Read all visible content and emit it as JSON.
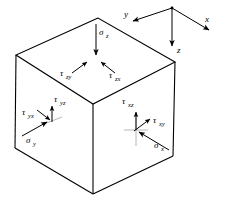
{
  "figure": {
    "name": "stress-element-cube",
    "background_color": "#ffffff",
    "stroke_color": "#000000",
    "width": 227,
    "height": 201
  },
  "axes": {
    "origin": {
      "x": 172,
      "y": 8
    },
    "items": [
      {
        "name": "x-axis",
        "label": "x",
        "label_x": 206,
        "label_y": 22,
        "tip_x": 212,
        "tip_y": 33
      },
      {
        "name": "y-axis",
        "label": "y",
        "label_x": 124,
        "label_y": 16,
        "tip_x": 129,
        "tip_y": 22
      },
      {
        "name": "z-axis",
        "label": "z",
        "label_x": 177,
        "label_y": 52,
        "tip_x": 172,
        "tip_y": 49
      }
    ]
  },
  "cube": {
    "vertices": {
      "top_back": {
        "x": 98,
        "y": 18
      },
      "top_left": {
        "x": 16,
        "y": 55
      },
      "top_right": {
        "x": 175,
        "y": 62
      },
      "top_front": {
        "x": 93,
        "y": 104
      },
      "bottom_left": {
        "x": 15,
        "y": 148
      },
      "bottom_right": {
        "x": 173,
        "y": 156
      },
      "bottom_front": {
        "x": 93,
        "y": 194
      }
    }
  },
  "stresses": {
    "top_face": [
      {
        "name": "sigma-z",
        "symbol": "σ",
        "subscript": "z",
        "kind": "normal",
        "label_x": 99,
        "label_y": 35,
        "arrow": {
          "x1": 96,
          "y1": 24,
          "x2": 96,
          "y2": 58
        }
      },
      {
        "name": "tau-zy",
        "symbol": "τ",
        "subscript": "zy",
        "kind": "shear",
        "label_x": 62,
        "label_y": 78,
        "arrow": {
          "x1": 72,
          "y1": 73,
          "x2": 89,
          "y2": 61
        }
      },
      {
        "name": "tau-zx",
        "symbol": "τ",
        "subscript": "zx",
        "kind": "shear",
        "label_x": 111,
        "label_y": 80,
        "arrow": {
          "x1": 115,
          "y1": 73,
          "x2": 100,
          "y2": 61
        }
      }
    ],
    "left_face": [
      {
        "name": "sigma-y",
        "symbol": "σ",
        "subscript": "y",
        "kind": "normal",
        "label_x": 27,
        "label_y": 143,
        "arrow": {
          "x1": 22,
          "y1": 136,
          "x2": 51,
          "y2": 120
        }
      },
      {
        "name": "tau-yx",
        "symbol": "τ",
        "subscript": "yx",
        "kind": "shear",
        "label_x": 24,
        "label_y": 117,
        "arrow": {
          "x1": 37,
          "y1": 110,
          "x2": 53,
          "y2": 122
        }
      },
      {
        "name": "tau-yz",
        "symbol": "τ",
        "subscript": "yz",
        "kind": "shear",
        "label_x": 55,
        "label_y": 105,
        "arrow": {
          "x1": 52,
          "y1": 120,
          "x2": 52,
          "y2": 104
        }
      }
    ],
    "right_face": [
      {
        "name": "sigma-x",
        "symbol": "σ",
        "subscript": "x",
        "kind": "normal",
        "label_x": 155,
        "label_y": 148,
        "arrow": {
          "x1": 169,
          "y1": 150,
          "x2": 137,
          "y2": 130
        }
      },
      {
        "name": "tau-xy",
        "symbol": "τ",
        "subscript": "xy",
        "kind": "shear",
        "label_x": 155,
        "label_y": 124,
        "arrow": {
          "x1": 136,
          "y1": 130,
          "x2": 152,
          "y2": 118
        }
      },
      {
        "name": "tau-xz",
        "symbol": "τ",
        "subscript": "xz",
        "kind": "shear",
        "label_x": 124,
        "label_y": 105,
        "arrow": {
          "x1": 136,
          "y1": 130,
          "x2": 136,
          "y2": 110
        }
      }
    ]
  }
}
